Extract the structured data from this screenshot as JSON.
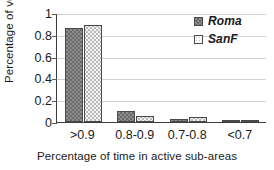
{
  "chart_data": {
    "type": "bar",
    "title": "",
    "subtitle": "",
    "xlabel": "Percentage of time in active sub-areas",
    "ylabel": "Percentage  of vehicles",
    "categories": [
      ">0.9",
      "0.8-0.9",
      "0.7-0.8",
      "<0.7"
    ],
    "series": [
      {
        "name": "Roma",
        "values": [
          0.86,
          0.1,
          0.03,
          0.008
        ],
        "pattern": "checkerboard",
        "color": "#8d8d8d"
      },
      {
        "name": "SanF",
        "values": [
          0.89,
          0.055,
          0.045,
          0.002
        ],
        "pattern": "dotted",
        "color": "#f3f3f3"
      }
    ],
    "ylim": [
      0,
      1
    ],
    "yticks": [
      "0",
      "0.2",
      "0.4",
      "0.6",
      "0.8",
      "1"
    ],
    "ytick_values": [
      0,
      0.2,
      0.4,
      0.6,
      0.8,
      1
    ],
    "grid": "horizontal",
    "legend_position": "top-right-inside",
    "legend_italic": true,
    "axis_color": "#3d3d3d",
    "gridline_color": "#d2d2d2",
    "bar_border_color": "#4a4a4a"
  }
}
